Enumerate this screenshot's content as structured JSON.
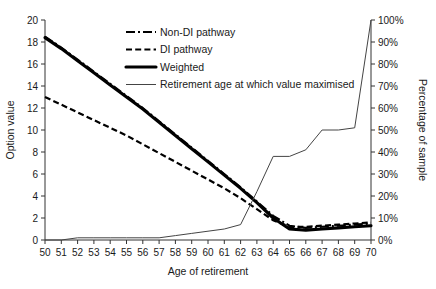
{
  "chart_data": {
    "type": "line",
    "title": "",
    "xlabel": "Age of retirement",
    "ylabel": "Option value",
    "y2label": "Percentage of sample",
    "x": [
      50,
      51,
      52,
      53,
      54,
      55,
      56,
      57,
      58,
      59,
      60,
      61,
      62,
      63,
      64,
      65,
      66,
      67,
      68,
      69,
      70
    ],
    "xlim": [
      50,
      70
    ],
    "ylim": [
      0,
      20
    ],
    "y2lim": [
      0,
      100
    ],
    "yticks": [
      0,
      2,
      4,
      6,
      8,
      10,
      12,
      14,
      16,
      18,
      20
    ],
    "y2ticks": [
      "0%",
      "10%",
      "20%",
      "30%",
      "40%",
      "50%",
      "60%",
      "70%",
      "80%",
      "90%",
      "100%"
    ],
    "xticks": [
      "50",
      "51",
      "52",
      "53",
      "54",
      "55",
      "56",
      "57",
      "58",
      "59",
      "60",
      "61",
      "62",
      "63",
      "64",
      "65",
      "66",
      "67",
      "68",
      "69",
      "70"
    ],
    "grid": false,
    "legend_position": "top-right",
    "series": [
      {
        "name": "Non-DI pathway",
        "axis": "left",
        "style": "dash-dot",
        "values": [
          18.5,
          17.5,
          16.4,
          15.3,
          14.2,
          13.1,
          12.0,
          10.8,
          9.6,
          8.4,
          7.2,
          6.0,
          4.8,
          3.5,
          2.2,
          1.3,
          1.1,
          1.2,
          1.3,
          1.4,
          1.5
        ]
      },
      {
        "name": "DI pathway",
        "axis": "left",
        "style": "dashed",
        "values": [
          13.0,
          12.3,
          11.6,
          10.9,
          10.2,
          9.5,
          8.7,
          7.9,
          7.1,
          6.3,
          5.5,
          4.7,
          3.8,
          2.8,
          1.8,
          1.2,
          1.2,
          1.3,
          1.4,
          1.5,
          1.6
        ]
      },
      {
        "name": "Weighted",
        "axis": "left",
        "style": "solid-bold",
        "values": [
          18.4,
          17.4,
          16.3,
          15.2,
          14.1,
          13.0,
          11.9,
          10.7,
          9.5,
          8.3,
          7.1,
          5.9,
          4.7,
          3.4,
          2.0,
          1.0,
          0.9,
          1.0,
          1.1,
          1.2,
          1.3
        ]
      },
      {
        "name": "Retirement age at which value maximised",
        "axis": "right",
        "style": "thin",
        "values": [
          0,
          0,
          1,
          1,
          1,
          1,
          1,
          1,
          2,
          3,
          4,
          5,
          7,
          22,
          38,
          38,
          41,
          50,
          50,
          51,
          100
        ]
      }
    ]
  },
  "legend": {
    "items": [
      {
        "label": "Non-DI pathway",
        "style": "dash-dot"
      },
      {
        "label": "DI pathway",
        "style": "dashed"
      },
      {
        "label": "Weighted",
        "style": "solid-bold"
      },
      {
        "label": "Retirement age at which value maximised",
        "style": "thin"
      }
    ]
  }
}
